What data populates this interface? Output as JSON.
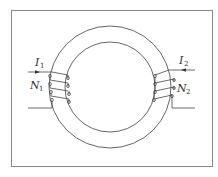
{
  "figure": {
    "type": "toroidal transformer",
    "frame": {
      "x": 11,
      "y": 10,
      "width": 201,
      "height": 156
    },
    "core": {
      "cx": 110,
      "cy": 87,
      "outer_radius": 61,
      "inner_radius": 45
    },
    "colors": {
      "line": "#555555",
      "frame": "#888888",
      "background": "#ffffff"
    }
  },
  "labels": {
    "I1": {
      "main": "I",
      "sub": "1"
    },
    "I2": {
      "main": "I",
      "sub": "2"
    },
    "N1": {
      "main": "N",
      "sub": "1"
    },
    "N2": {
      "main": "N",
      "sub": "2"
    }
  },
  "coils": {
    "left": {
      "turns": 4,
      "label": "N1",
      "current": "I1",
      "current_direction": "in"
    },
    "right": {
      "turns": 4,
      "label": "N2",
      "current": "I2",
      "current_direction": "out"
    }
  }
}
